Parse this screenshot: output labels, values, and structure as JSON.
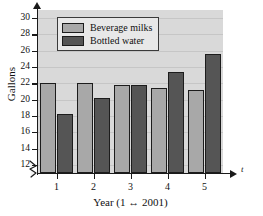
{
  "chart_data": {
    "type": "bar",
    "title": "",
    "subtitle": "",
    "xlabel": "Year (1 ↔ 2001)",
    "ylabel": "Gallons",
    "x_axis_variable": "t",
    "categories": [
      "1",
      "2",
      "3",
      "4",
      "5"
    ],
    "series": [
      {
        "name": "Beverage milks",
        "color": "#a8a8a8",
        "values": [
          22.0,
          22.0,
          21.8,
          21.4,
          21.2
        ]
      },
      {
        "name": "Bottled water",
        "color": "#555555",
        "values": [
          18.2,
          20.2,
          21.8,
          23.4,
          25.6
        ]
      }
    ],
    "ylim": [
      11.0,
      31.0
    ],
    "ytick_values": [
      12,
      14,
      16,
      18,
      20,
      22,
      24,
      26,
      28,
      30
    ],
    "ytick_labels": [
      "12",
      "14",
      "16",
      "18",
      "20",
      "22",
      "24",
      "26",
      "28",
      "30"
    ],
    "grid": true,
    "grid_axis": "y",
    "axis_break": true,
    "legend_position": "upper-left",
    "plot_background": "#d9d9d9",
    "figure_background": "#ffffff"
  }
}
